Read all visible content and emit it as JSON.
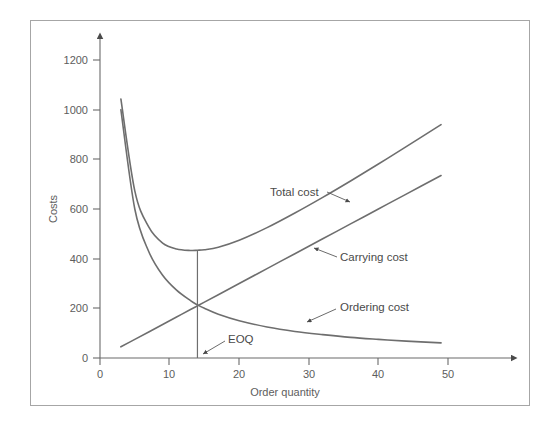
{
  "chart_data": {
    "type": "line",
    "title": "",
    "xlabel": "Order quantity",
    "ylabel": "Costs",
    "xlim": [
      0,
      55
    ],
    "ylim": [
      0,
      1280
    ],
    "grid": false,
    "legend_position": "inline-annotations",
    "x_ticks": [
      "0",
      "10",
      "20",
      "30",
      "40",
      "50"
    ],
    "x_tick_values": [
      0,
      10,
      20,
      30,
      40,
      50
    ],
    "y_ticks": [
      "0",
      "200",
      "400",
      "600",
      "800",
      "1000",
      "1200"
    ],
    "y_tick_values": [
      0,
      200,
      400,
      600,
      800,
      1000,
      1200
    ],
    "x": [
      3,
      5,
      7,
      9,
      11,
      13,
      14,
      15,
      17,
      20,
      24,
      28,
      32,
      36,
      40,
      44,
      49
    ],
    "series": [
      {
        "name": "Total cost",
        "label": "Total cost",
        "values": [
          1043,
          673,
          528,
          463,
          439,
          433,
          434,
          436,
          446,
          474,
          525,
          584,
          647,
          713,
          781,
          851,
          940
        ]
      },
      {
        "name": "Ordering cost",
        "label": "Ordering cost",
        "values": [
          1000,
          600,
          429,
          333,
          273,
          231,
          214,
          200,
          176,
          150,
          125,
          107,
          94,
          83,
          75,
          68,
          61
        ]
      },
      {
        "name": "Carrying cost",
        "label": "Carrying cost",
        "values": [
          45,
          75,
          105,
          135,
          165,
          195,
          210,
          225,
          255,
          300,
          360,
          420,
          480,
          540,
          600,
          660,
          735
        ]
      }
    ],
    "annotations": [
      {
        "text": "EOQ",
        "meaning": "economic-order-quantity",
        "x_value": 14,
        "y_value": 0
      }
    ],
    "eoq": {
      "x_value": 14,
      "minimum_total_cost": 433,
      "intersection_cost": 210
    },
    "colors": {
      "curve": "#6e6e6e",
      "axis": "#6b6b6b",
      "text": "#5d5d5d",
      "frame": "#a6a6a6",
      "background": "#ffffff"
    }
  }
}
